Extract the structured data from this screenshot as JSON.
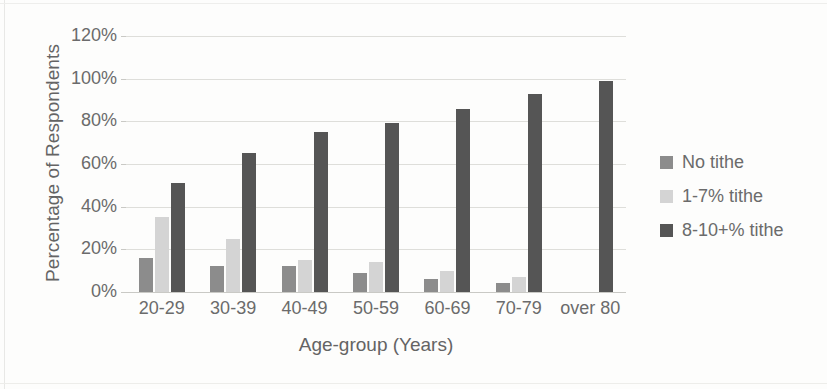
{
  "chart_data": {
    "type": "bar",
    "title": "",
    "xlabel": "Age-group (Years)",
    "ylabel": "Percentage of Respondents",
    "categories": [
      "20-29",
      "30-39",
      "40-49",
      "50-59",
      "60-69",
      "70-79",
      "over 80"
    ],
    "series": [
      {
        "name": "No tithe",
        "values": [
          16,
          12,
          12,
          9,
          6,
          4,
          0
        ],
        "color": "#8c8c8c"
      },
      {
        "name": "1-7% tithe",
        "values": [
          35,
          25,
          15,
          14,
          10,
          7,
          0
        ],
        "color": "#d4d4d4"
      },
      {
        "name": "8-10+% tithe",
        "values": [
          51,
          65,
          75,
          79,
          86,
          93,
          99
        ],
        "color": "#555555"
      }
    ],
    "ylim": [
      0,
      120
    ],
    "ytick_labels": [
      "0%",
      "20%",
      "40%",
      "60%",
      "80%",
      "100%",
      "120%"
    ],
    "ytick_values": [
      0,
      20,
      40,
      60,
      80,
      100,
      120
    ],
    "grid": true,
    "legend_position": "right",
    "value_suffix": "%"
  },
  "legend": {
    "items": [
      {
        "label": "No tithe"
      },
      {
        "label": "1-7% tithe"
      },
      {
        "label": "8-10+% tithe"
      }
    ]
  }
}
